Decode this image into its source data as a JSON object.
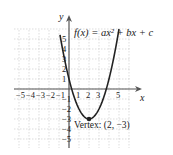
{
  "figure": {
    "function_label": "f(x) = ax² + bx + c",
    "x_axis_label": "x",
    "y_axis_label": "y",
    "x_ticks": [
      "-5",
      "-4",
      "-3",
      "-2",
      "-1",
      "1",
      "2",
      "3",
      "5"
    ],
    "y_ticks": [
      "5",
      "4",
      "3",
      "2",
      "1",
      "-1",
      "-2",
      "-3",
      "-4",
      "-5"
    ],
    "vertex_label": "Vertex:  (2, −3)",
    "vertex": [
      2,
      -3
    ],
    "curve_color": "#222222",
    "grid_color": "#bbbbbb"
  },
  "chart_data": {
    "type": "line",
    "xlabel": "x",
    "ylabel": "y",
    "xlim": [
      -5,
      6
    ],
    "ylim": [
      -5,
      6
    ],
    "grid": true,
    "series": [
      {
        "name": "f(x)",
        "x": [
          -1,
          0,
          1,
          2,
          3,
          4,
          5
        ],
        "values": [
          6,
          1,
          -2,
          -3,
          -2,
          1,
          6
        ]
      }
    ],
    "annotations": [
      {
        "text": "Vertex: (2, -3)",
        "x": 2,
        "y": -3
      }
    ]
  }
}
